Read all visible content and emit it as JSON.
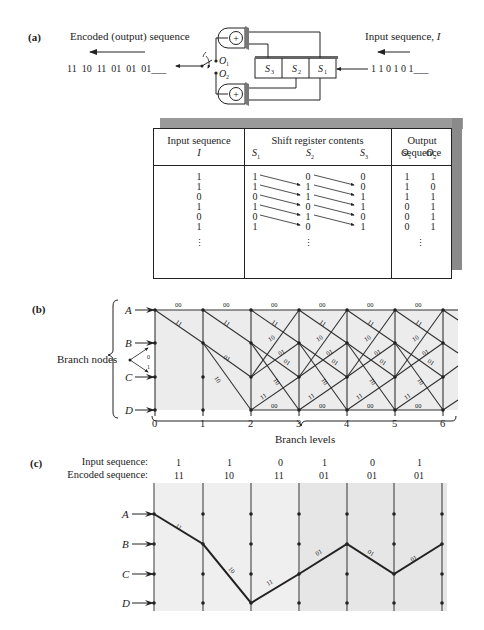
{
  "part_a": {
    "label": "(a)",
    "output_title": "Encoded (output) sequence",
    "output_bits": "11  10  11  01  01  01___",
    "input_title": "Input sequence, ",
    "input_title_var": "I",
    "input_bits": "1 1 0 1 0 1___",
    "register": [
      "S3",
      "S2",
      "S1"
    ],
    "register_labels": {
      "s3": "S",
      "s3_sub": "3",
      "s2": "S",
      "s2_sub": "2",
      "s1": "S",
      "s1_sub": "1"
    },
    "outputs": {
      "o1": "O",
      "o1_sub": "1",
      "o2": "O",
      "o2_sub": "2"
    },
    "adder_symbol": "+"
  },
  "table": {
    "headers": {
      "input": "Input sequence",
      "input_var": "I",
      "shift": "Shift register contents",
      "shift_vars": [
        "S1",
        "S2",
        "S3"
      ],
      "output": "Output sequence",
      "output_vars": [
        "O1",
        "O2"
      ]
    },
    "rows": [
      {
        "I": "1",
        "S1": "1",
        "S2": "0",
        "S3": "0",
        "O1": "1",
        "O2": "1"
      },
      {
        "I": "1",
        "S1": "1",
        "S2": "1",
        "S3": "0",
        "O1": "1",
        "O2": "0"
      },
      {
        "I": "0",
        "S1": "0",
        "S2": "1",
        "S3": "1",
        "O1": "1",
        "O2": "1"
      },
      {
        "I": "1",
        "S1": "1",
        "S2": "0",
        "S3": "1",
        "O1": "0",
        "O2": "1"
      },
      {
        "I": "0",
        "S1": "0",
        "S2": "1",
        "S3": "0",
        "O1": "0",
        "O2": "1"
      },
      {
        "I": "1",
        "S1": "1",
        "S2": "0",
        "S3": "1",
        "O1": "0",
        "O2": "1"
      }
    ],
    "continuation": "⋮"
  },
  "part_b": {
    "label": "(b)",
    "nodes_label": "Branch nodes",
    "states": [
      "A",
      "B",
      "C",
      "D"
    ],
    "branch_levels_label": "Branch levels",
    "levels": [
      "0",
      "1",
      "2",
      "3",
      "4",
      "5",
      "6"
    ],
    "legend_bits": {
      "up": "0",
      "down": "1"
    },
    "edges": [
      {
        "from": "A",
        "to": "A",
        "label": "00"
      },
      {
        "from": "A",
        "to": "B",
        "label": "11"
      },
      {
        "from": "B",
        "to": "C",
        "label": "01"
      },
      {
        "from": "B",
        "to": "D",
        "label": "10"
      },
      {
        "from": "C",
        "to": "A",
        "label": "10"
      },
      {
        "from": "C",
        "to": "B",
        "label": "01"
      },
      {
        "from": "D",
        "to": "C",
        "label": "11"
      },
      {
        "from": "D",
        "to": "D",
        "label": "00"
      }
    ]
  },
  "part_c": {
    "label": "(c)",
    "input_label": "Input sequence:",
    "encoded_label": "Encoded sequence:",
    "input_seq": [
      "1",
      "1",
      "0",
      "1",
      "0",
      "1"
    ],
    "encoded_seq": [
      "11",
      "10",
      "11",
      "01",
      "01",
      "01"
    ],
    "states": [
      "A",
      "B",
      "C",
      "D"
    ],
    "path": [
      "A",
      "B",
      "D",
      "C",
      "B",
      "C",
      "B"
    ],
    "path_labels": [
      "11",
      "10",
      "11",
      "01",
      "01",
      "01"
    ]
  }
}
